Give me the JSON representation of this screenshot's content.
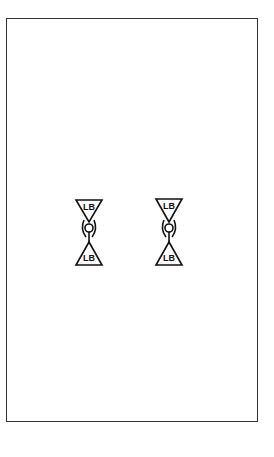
{
  "diagram": {
    "border_color": "#333333",
    "stroke_color": "#111111",
    "symbols": [
      {
        "name": "left-fixture",
        "top_label": "LB",
        "bottom_label": "LB",
        "cx": 89
      },
      {
        "name": "right-fixture",
        "top_label": "LB",
        "bottom_label": "LB",
        "cx": 169
      }
    ]
  }
}
